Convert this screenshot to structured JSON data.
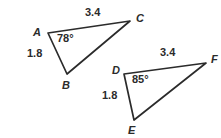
{
  "figure": {
    "background_color": "#ffffff",
    "stroke_color": "#2b2b2b",
    "text_color": "#2b2b2b",
    "triangles": [
      {
        "name": "triangle-abc",
        "vertices": [
          {
            "label": "A",
            "x": 48,
            "y": 33
          },
          {
            "label": "C",
            "x": 130,
            "y": 21
          },
          {
            "label": "B",
            "x": 67,
            "y": 74
          }
        ],
        "side_labels": [
          {
            "name": "side-ac-length",
            "value": "3.4"
          },
          {
            "name": "side-ab-length",
            "value": "1.8"
          }
        ],
        "angle_labels": [
          {
            "name": "angle-a",
            "value": "78°"
          }
        ]
      },
      {
        "name": "triangle-def",
        "vertices": [
          {
            "label": "D",
            "x": 124,
            "y": 74
          },
          {
            "label": "F",
            "x": 206,
            "y": 63
          },
          {
            "label": "E",
            "x": 134,
            "y": 120
          }
        ],
        "side_labels": [
          {
            "name": "side-df-length",
            "value": "3.4"
          },
          {
            "name": "side-de-length",
            "value": "1.8"
          }
        ],
        "angle_labels": [
          {
            "name": "angle-d",
            "value": "85°"
          }
        ]
      }
    ]
  },
  "labels": {
    "a_vertex": "A",
    "b_vertex": "B",
    "c_vertex": "C",
    "d_vertex": "D",
    "e_vertex": "E",
    "f_vertex": "F",
    "ac_length": "3.4",
    "ab_length": "1.8",
    "angle_a": "78°",
    "df_length": "3.4",
    "de_length": "1.8",
    "angle_d": "85°"
  }
}
